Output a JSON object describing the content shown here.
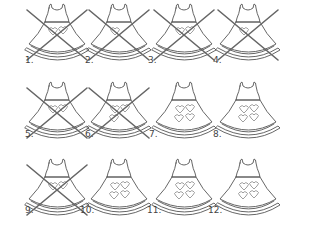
{
  "worksheet": {
    "items": [
      {
        "label": "1.",
        "hearts": 2,
        "crossed": true,
        "x": 25,
        "y": 2,
        "lx": 25,
        "ly": 56
      },
      {
        "label": "2.",
        "hearts": 1,
        "crossed": true,
        "x": 87,
        "y": 2,
        "lx": 85,
        "ly": 56
      },
      {
        "label": "3.",
        "hearts": 2,
        "crossed": true,
        "x": 152,
        "y": 2,
        "lx": 148,
        "ly": 56
      },
      {
        "label": "4.",
        "hearts": 1,
        "crossed": true,
        "x": 216,
        "y": 2,
        "lx": 213,
        "ly": 56
      },
      {
        "label": "5.",
        "hearts": 2,
        "crossed": true,
        "x": 25,
        "y": 80,
        "lx": 25,
        "ly": 130
      },
      {
        "label": "6.",
        "hearts": 3,
        "crossed": true,
        "x": 87,
        "y": 80,
        "lx": 85,
        "ly": 130
      },
      {
        "label": "7.",
        "hearts": 4,
        "crossed": false,
        "x": 152,
        "y": 80,
        "lx": 149,
        "ly": 130
      },
      {
        "label": "8.",
        "hearts": 4,
        "crossed": false,
        "x": 216,
        "y": 80,
        "lx": 213,
        "ly": 130
      },
      {
        "label": "9.",
        "hearts": 2,
        "crossed": true,
        "x": 25,
        "y": 157,
        "lx": 25,
        "ly": 206
      },
      {
        "label": "10.",
        "hearts": 4,
        "crossed": false,
        "x": 87,
        "y": 157,
        "lx": 80,
        "ly": 206
      },
      {
        "label": "11.",
        "hearts": 4,
        "crossed": false,
        "x": 152,
        "y": 157,
        "lx": 147,
        "ly": 206
      },
      {
        "label": "12.",
        "hearts": 4,
        "crossed": false,
        "x": 216,
        "y": 157,
        "lx": 208,
        "ly": 206
      }
    ]
  },
  "colors": {
    "outline": "#555555",
    "cross": "#666666",
    "label": "#444444"
  }
}
